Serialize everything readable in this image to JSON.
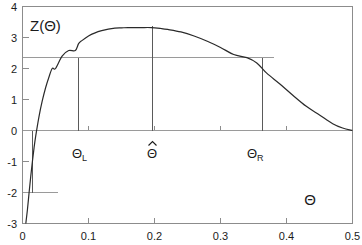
{
  "chart_data": {
    "type": "line",
    "title": "",
    "subtitle": "",
    "xlabel": "Θ",
    "ylabel": "Z(Θ)",
    "xlim": [
      0,
      0.5
    ],
    "ylim": [
      -3,
      4
    ],
    "grid": false,
    "legend": "none",
    "x_ticks": [
      "0",
      "0.1",
      "0.2",
      "0.3",
      "0.4",
      "0.5"
    ],
    "x_tick_values": [
      0,
      0.1,
      0.2,
      0.3,
      0.4,
      0.5
    ],
    "y_ticks": [
      "4",
      "3",
      "2",
      "1",
      "0",
      "-1",
      "-2",
      "-3"
    ],
    "y_tick_values": [
      4,
      3,
      2,
      1,
      0,
      -1,
      -2,
      -3
    ],
    "series": [
      {
        "name": "Z(Θ) log-likelihood curve",
        "x": [
          0.005,
          0.0075,
          0.01,
          0.0125,
          0.015,
          0.0175,
          0.02,
          0.025,
          0.03,
          0.035,
          0.04,
          0.045,
          0.05,
          0.06,
          0.07,
          0.08,
          0.085,
          0.09,
          0.1,
          0.11,
          0.12,
          0.13,
          0.14,
          0.15,
          0.16,
          0.17,
          0.18,
          0.195,
          0.21,
          0.22,
          0.24,
          0.26,
          0.28,
          0.3,
          0.32,
          0.34,
          0.355,
          0.37,
          0.39,
          0.41,
          0.43,
          0.45,
          0.47,
          0.485,
          0.5
        ],
        "y": [
          -3.0,
          -2.55,
          -2.0,
          -1.48,
          -1.0,
          -0.56,
          -0.18,
          0.45,
          0.96,
          1.38,
          1.72,
          2.0,
          2.0,
          2.4,
          2.58,
          2.8,
          2.35,
          2.9,
          3.05,
          3.15,
          3.22,
          3.27,
          3.3,
          3.31,
          3.32,
          3.32,
          3.32,
          3.32,
          3.29,
          3.26,
          3.18,
          3.05,
          2.88,
          2.68,
          2.45,
          2.18,
          2.35,
          1.85,
          1.5,
          1.13,
          0.78,
          0.5,
          0.22,
          0.08,
          0.0
        ]
      }
    ],
    "reference_lines": {
      "horizontal_threshold_value": 2.35,
      "horizontal_threshold_label": "",
      "lower_tail_value": -2.0,
      "zero_axis_value": 0
    },
    "markers": [
      {
        "id": "theta-left",
        "label": "Θ",
        "subscript": "L",
        "x_value": 0.085,
        "y_top": 2.35,
        "y_bottom": 0
      },
      {
        "id": "theta-hat",
        "label": "Θ",
        "subscript": "",
        "hat": true,
        "x_value": 0.195,
        "y_top": 3.32,
        "y_bottom": 0
      },
      {
        "id": "theta-right",
        "label": "Θ",
        "subscript": "R",
        "x_value": 0.355,
        "y_top": 2.35,
        "y_bottom": 0
      }
    ],
    "annotations": [
      {
        "id": "y-axis-name",
        "text": "Z(Θ)"
      },
      {
        "id": "x-axis-name",
        "text": "Θ"
      },
      {
        "id": "theta-left-label",
        "text": "Θ",
        "sub": "L"
      },
      {
        "id": "theta-hat-label",
        "text": "Θ̂"
      },
      {
        "id": "theta-right-label",
        "text": "Θ",
        "sub": "R"
      }
    ],
    "colors": {
      "curve": "#2a2a2a",
      "frame": "#8c8c8c",
      "reference": "#9a9a9a",
      "drop": "#5a5a5a",
      "background": "#ffffff",
      "text": "#1b1b1b"
    }
  },
  "labels": {
    "y_axis_name": "Z(Θ)",
    "x_axis_name": "Θ",
    "theta_l_base": "Θ",
    "theta_l_sub": "L",
    "theta_hat_base": "Θ",
    "theta_r_base": "Θ",
    "theta_r_sub": "R",
    "ytick_4": "4",
    "ytick_3": "3",
    "ytick_2": "2",
    "ytick_1": "1",
    "ytick_0": "0",
    "ytick_m1": "-1",
    "ytick_m2": "-2",
    "ytick_m3": "-3",
    "xtick_0": "0",
    "xtick_1": "0.1",
    "xtick_2": "0.2",
    "xtick_3": "0.3",
    "xtick_4": "0.4",
    "xtick_5": "0.5"
  }
}
